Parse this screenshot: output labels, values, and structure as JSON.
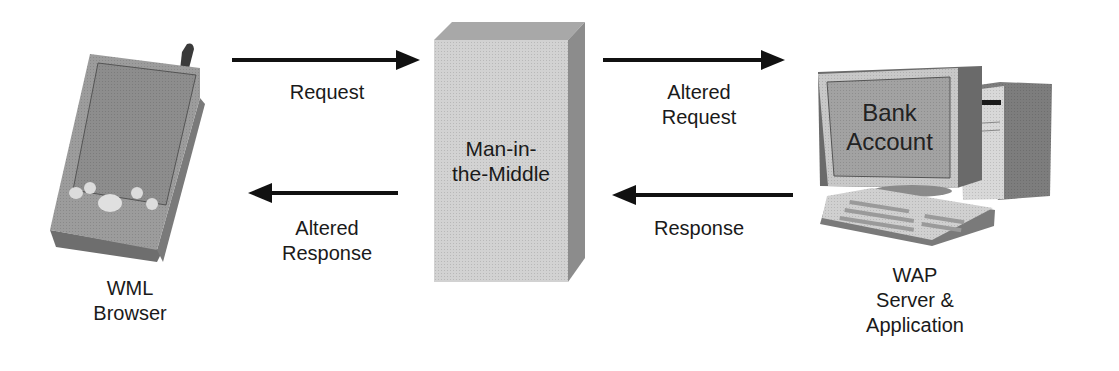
{
  "diagram": {
    "title": "",
    "nodes": [
      {
        "id": "wml-browser",
        "label_lines": [
          "WML",
          "Browser"
        ],
        "icon": "pda-icon"
      },
      {
        "id": "man-in-the-middle",
        "label_lines": [
          "Man-in-",
          "the-Middle"
        ],
        "icon": "attacker-box"
      },
      {
        "id": "wap-server",
        "label_lines": [
          "WAP",
          "Server &",
          "Application"
        ],
        "icon": "desktop-computer-icon",
        "screen_text_lines": [
          "Bank",
          "Account"
        ]
      }
    ],
    "edges": [
      {
        "from": "wml-browser",
        "to": "man-in-the-middle",
        "label_lines": [
          "Request"
        ],
        "direction": "right"
      },
      {
        "from": "man-in-the-middle",
        "to": "wap-server",
        "label_lines": [
          "Altered",
          "Request"
        ],
        "direction": "right"
      },
      {
        "from": "wap-server",
        "to": "man-in-the-middle",
        "label_lines": [
          "Response"
        ],
        "direction": "left"
      },
      {
        "from": "man-in-the-middle",
        "to": "wml-browser",
        "label_lines": [
          "Altered",
          "Response"
        ],
        "direction": "left"
      }
    ]
  },
  "colors": {
    "arrow": "#111111",
    "device_gray": "#9a9a9a",
    "box_front": "#d4d4d4",
    "box_side": "#8c8c8c",
    "box_top": "#a8a8a8"
  }
}
